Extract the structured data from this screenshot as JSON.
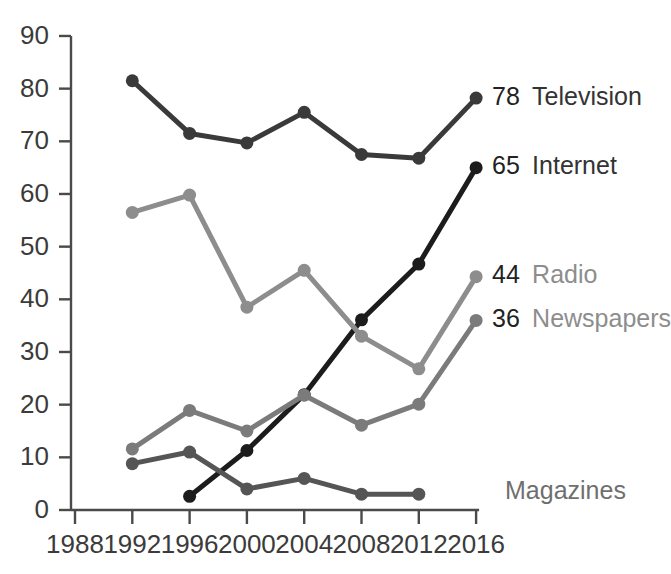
{
  "chart_data": {
    "type": "line",
    "title": "",
    "subtitle": "",
    "xlabel": "",
    "ylabel": "",
    "x": [
      1988,
      1992,
      1996,
      2000,
      2004,
      2008,
      2012,
      2016
    ],
    "x_tick_labels": [
      "1988",
      "1992",
      "1996",
      "2000",
      "2004",
      "2008",
      "2012",
      "2016"
    ],
    "y_tick_labels": [
      "0",
      "10",
      "20",
      "30",
      "40",
      "50",
      "60",
      "70",
      "80",
      "90"
    ],
    "y_ticks": [
      0,
      10,
      20,
      30,
      40,
      50,
      60,
      70,
      80,
      90
    ],
    "xlim": [
      1988,
      2016
    ],
    "ylim": [
      0,
      90
    ],
    "grid": false,
    "legend_position": "right-inline-end-labels",
    "series": [
      {
        "name": "Television",
        "color": "#3a3a3a",
        "end_value_label": "78",
        "label_color": "#333333",
        "points": [
          {
            "x": 1992,
            "y": 81.5
          },
          {
            "x": 1996,
            "y": 71.5
          },
          {
            "x": 2000,
            "y": 69.7
          },
          {
            "x": 2004,
            "y": 75.5
          },
          {
            "x": 2008,
            "y": 67.5
          },
          {
            "x": 2012,
            "y": 66.8
          },
          {
            "x": 2016,
            "y": 78.2
          }
        ]
      },
      {
        "name": "Internet",
        "color": "#1c1c1c",
        "end_value_label": "65",
        "label_color": "#333333",
        "points": [
          {
            "x": 1996,
            "y": 2.6
          },
          {
            "x": 2000,
            "y": 11.3
          },
          {
            "x": 2004,
            "y": 21.9
          },
          {
            "x": 2008,
            "y": 36.1
          },
          {
            "x": 2012,
            "y": 46.7
          },
          {
            "x": 2016,
            "y": 65.0
          }
        ]
      },
      {
        "name": "Radio",
        "color": "#8d8d8d",
        "end_value_label": "44",
        "label_color": "#8d8d8d",
        "points": [
          {
            "x": 1992,
            "y": 56.5
          },
          {
            "x": 1996,
            "y": 59.8
          },
          {
            "x": 2000,
            "y": 38.5
          },
          {
            "x": 2004,
            "y": 45.5
          },
          {
            "x": 2008,
            "y": 33.0
          },
          {
            "x": 2012,
            "y": 26.8
          },
          {
            "x": 2016,
            "y": 44.3
          }
        ]
      },
      {
        "name": "Newspapers",
        "color": "#7b7b7b",
        "end_value_label": "36",
        "label_color": "#8d8d8d",
        "points": [
          {
            "x": 1992,
            "y": 11.6
          },
          {
            "x": 1996,
            "y": 18.9
          },
          {
            "x": 2000,
            "y": 15.0
          },
          {
            "x": 2004,
            "y": 21.8
          },
          {
            "x": 2008,
            "y": 16.1
          },
          {
            "x": 2012,
            "y": 20.1
          },
          {
            "x": 2016,
            "y": 36.0
          }
        ]
      },
      {
        "name": "Magazines",
        "color": "#555555",
        "end_value_label": "",
        "label_color": "#6f6f6f",
        "points": [
          {
            "x": 1992,
            "y": 8.8
          },
          {
            "x": 1996,
            "y": 11.0
          },
          {
            "x": 2000,
            "y": 4.0
          },
          {
            "x": 2004,
            "y": 6.0
          },
          {
            "x": 2008,
            "y": 3.0
          },
          {
            "x": 2012,
            "y": 3.0
          }
        ]
      }
    ]
  }
}
